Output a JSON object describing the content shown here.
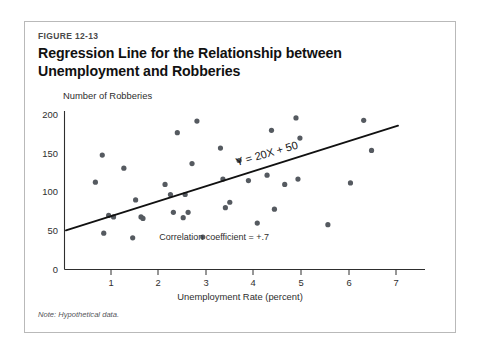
{
  "figure": {
    "number": "FIGURE 12-13",
    "title": "Regression Line for the Relationship between Unemployment and Robberies",
    "note": "Note: Hypothetical data."
  },
  "chart_data": {
    "type": "scatter",
    "title": "Regression Line for the Relationship between Unemployment and Robberies",
    "xlabel": "Unemployment Rate (percent)",
    "ylabel": "Number of Robberies",
    "xlim": [
      0,
      7.35
    ],
    "ylim": [
      0,
      205
    ],
    "xticks": [
      1,
      2,
      3,
      4,
      5,
      6,
      7
    ],
    "xtick_labels": [
      "1",
      "2",
      "3",
      "4",
      "5",
      "6",
      "7"
    ],
    "yticks": [
      0,
      50,
      100,
      150,
      200
    ],
    "ytick_labels": [
      "0",
      "50",
      "100",
      "150",
      "200"
    ],
    "grid": false,
    "legend": null,
    "point_color": "#555a60",
    "line_color": "#111111",
    "series": [
      {
        "name": "Observations",
        "x": [
          0.63,
          0.77,
          0.8,
          0.9,
          1.0,
          1.21,
          1.39,
          1.45,
          1.56,
          1.6,
          2.05,
          2.16,
          2.22,
          2.3,
          2.42,
          2.46,
          2.52,
          2.6,
          2.7,
          2.82,
          3.18,
          3.23,
          3.28,
          3.37,
          3.56,
          3.75,
          3.93,
          4.13,
          4.22,
          4.28,
          4.49,
          4.72,
          4.76,
          4.8,
          5.37,
          5.83,
          6.1,
          6.26
        ],
        "y": [
          113,
          148,
          47,
          70,
          68,
          131,
          41,
          90,
          68,
          66,
          110,
          97,
          74,
          177,
          67,
          97,
          74,
          137,
          192,
          42,
          157,
          117,
          80,
          87,
          141,
          115,
          60,
          122,
          180,
          78,
          110,
          196,
          117,
          170,
          58,
          112,
          193,
          154
        ]
      }
    ],
    "regression_line": {
      "equation_label": "Y = 20X + 50",
      "slope": 20,
      "intercept": 50,
      "x_start": 0.03,
      "x_end": 6.8
    },
    "annotations": [
      {
        "text": "Correlation coefficient = +.7",
        "x": 3.05,
        "y": 38
      }
    ]
  }
}
